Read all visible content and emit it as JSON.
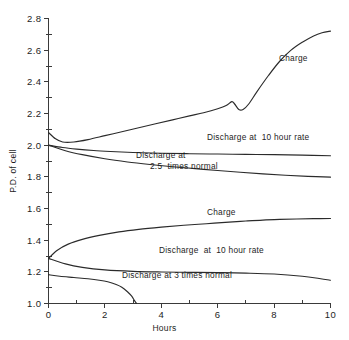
{
  "chart_data": {
    "type": "line",
    "title": "",
    "xlabel": "Hours",
    "ylabel": "P.D. of cell",
    "xlim": [
      0,
      10
    ],
    "ylim": [
      1.0,
      2.8
    ],
    "grid": false,
    "legend_position": "inline-annotations",
    "x_ticks": [
      {
        "value": 0,
        "label": "0"
      },
      {
        "value": 1,
        "label": ""
      },
      {
        "value": 2,
        "label": "2"
      },
      {
        "value": 3,
        "label": ""
      },
      {
        "value": 4,
        "label": "4"
      },
      {
        "value": 5,
        "label": ""
      },
      {
        "value": 6,
        "label": "6"
      },
      {
        "value": 7,
        "label": ""
      },
      {
        "value": 8,
        "label": "8"
      },
      {
        "value": 9,
        "label": ""
      },
      {
        "value": 10,
        "label": "10"
      }
    ],
    "y_ticks": [
      {
        "value": 1.0,
        "label": "1.0"
      },
      {
        "value": 1.1,
        "label": ""
      },
      {
        "value": 1.2,
        "label": "1.2"
      },
      {
        "value": 1.3,
        "label": ""
      },
      {
        "value": 1.4,
        "label": "1.4"
      },
      {
        "value": 1.5,
        "label": ""
      },
      {
        "value": 1.6,
        "label": "1.6"
      },
      {
        "value": 1.7,
        "label": ""
      },
      {
        "value": 1.8,
        "label": "1.8"
      },
      {
        "value": 1.9,
        "label": ""
      },
      {
        "value": 2.0,
        "label": "2.0"
      },
      {
        "value": 2.1,
        "label": ""
      },
      {
        "value": 2.2,
        "label": "2.2"
      },
      {
        "value": 2.3,
        "label": ""
      },
      {
        "value": 2.4,
        "label": "2.4"
      },
      {
        "value": 2.5,
        "label": ""
      },
      {
        "value": 2.6,
        "label": "2.6"
      },
      {
        "value": 2.7,
        "label": ""
      },
      {
        "value": 2.8,
        "label": "2.8"
      }
    ],
    "series": [
      {
        "name": "Charge (upper)",
        "label": "Charge",
        "group": "upper",
        "color": "#2b2b2b",
        "x": [
          0,
          0.25,
          0.5,
          0.9,
          1.4,
          2.0,
          2.6,
          3.2,
          3.8,
          4.4,
          5.0,
          5.5,
          6.0,
          6.3,
          6.5,
          6.6,
          6.75,
          6.9,
          7.1,
          7.4,
          7.8,
          8.2,
          8.6,
          9.0,
          9.4,
          9.7,
          10.0
        ],
        "y": [
          2.08,
          2.04,
          2.02,
          2.02,
          2.035,
          2.06,
          2.085,
          2.11,
          2.135,
          2.16,
          2.185,
          2.205,
          2.23,
          2.25,
          2.275,
          2.26,
          2.225,
          2.225,
          2.26,
          2.34,
          2.44,
          2.53,
          2.6,
          2.65,
          2.69,
          2.71,
          2.72
        ]
      },
      {
        "name": "Discharge at 10 hour rate (upper)",
        "label": "Discharge at  10 hour rate",
        "group": "upper",
        "color": "#2b2b2b",
        "x": [
          0,
          0.5,
          1.0,
          1.6,
          2.2,
          3.0,
          4.0,
          5.0,
          6.0,
          7.0,
          8.0,
          9.0,
          10.0
        ],
        "y": [
          2.0,
          1.985,
          1.975,
          1.966,
          1.96,
          1.954,
          1.949,
          1.946,
          1.944,
          1.942,
          1.94,
          1.937,
          1.933
        ]
      },
      {
        "name": "Discharge at 2.5 times normal (upper)",
        "label": "Discharge at\n    2.5  times normal",
        "group": "upper",
        "color": "#2b2b2b",
        "x": [
          0,
          0.6,
          1.2,
          2.0,
          2.8,
          3.6,
          4.4,
          5.2,
          6.0,
          6.8,
          7.6,
          8.4,
          9.2,
          10.0
        ],
        "y": [
          2.0,
          1.965,
          1.94,
          1.914,
          1.894,
          1.878,
          1.864,
          1.852,
          1.84,
          1.829,
          1.819,
          1.81,
          1.803,
          1.798
        ]
      },
      {
        "name": "Charge (lower)",
        "label": "Charge",
        "group": "lower",
        "color": "#2b2b2b",
        "x": [
          0,
          0.3,
          0.7,
          1.2,
          1.8,
          2.5,
          3.2,
          4.0,
          4.8,
          5.6,
          6.4,
          7.0,
          7.6,
          8.2,
          8.8,
          9.4,
          10.0
        ],
        "y": [
          1.285,
          1.335,
          1.375,
          1.405,
          1.43,
          1.452,
          1.468,
          1.482,
          1.494,
          1.504,
          1.514,
          1.521,
          1.527,
          1.531,
          1.534,
          1.536,
          1.537
        ]
      },
      {
        "name": "Discharge at 10 hour rate (lower)",
        "label": "Discharge  at  10 hour rate",
        "group": "lower",
        "color": "#2b2b2b",
        "x": [
          0,
          0.6,
          1.2,
          2.0,
          3.0,
          4.0,
          5.0,
          6.0,
          7.0,
          8.0,
          9.0,
          9.6,
          10.0
        ],
        "y": [
          1.285,
          1.25,
          1.228,
          1.212,
          1.203,
          1.199,
          1.197,
          1.195,
          1.192,
          1.186,
          1.172,
          1.158,
          1.147
        ]
      },
      {
        "name": "Discharge at 3 times normal (lower)",
        "label": "Discharge at 3 times normal",
        "group": "lower",
        "color": "#2b2b2b",
        "x": [
          0,
          0.4,
          0.9,
          1.4,
          1.8,
          2.1,
          2.4,
          2.6,
          2.8,
          2.95,
          3.05,
          3.12
        ],
        "y": [
          1.182,
          1.172,
          1.164,
          1.156,
          1.147,
          1.137,
          1.12,
          1.103,
          1.074,
          1.046,
          1.018,
          1.0
        ]
      }
    ],
    "annotations": [
      {
        "name": "charge-upper-label",
        "text": "Charge",
        "x_px": 279,
        "y_px": 61,
        "align": "left"
      },
      {
        "name": "discharge-10hr-upper-label",
        "text": "Discharge at  10 hour rate",
        "x_px": 207,
        "y_px": 140,
        "align": "left"
      },
      {
        "name": "discharge-25x-upper-label-line1",
        "text": "Discharge at",
        "x_px": 136,
        "y_px": 158,
        "align": "left"
      },
      {
        "name": "discharge-25x-upper-label-line2",
        "text": "2.5  times normal",
        "x_px": 150,
        "y_px": 169,
        "align": "left"
      },
      {
        "name": "charge-lower-label",
        "text": "Charge",
        "x_px": 207,
        "y_px": 215,
        "align": "left"
      },
      {
        "name": "discharge-10hr-lower-label",
        "text": "Discharge  at  10 hour rate",
        "x_px": 159,
        "y_px": 253,
        "align": "left"
      },
      {
        "name": "discharge-3x-lower-label",
        "text": "Discharge at 3 times normal",
        "x_px": 122,
        "y_px": 278,
        "align": "left"
      }
    ]
  },
  "axes": {
    "y_axis_title": "P.D. of cell",
    "x_axis_title": "Hours"
  },
  "colors": {
    "background": "#ffffff",
    "ink": "#2b2b2b",
    "axis": "#3a3a3a"
  }
}
